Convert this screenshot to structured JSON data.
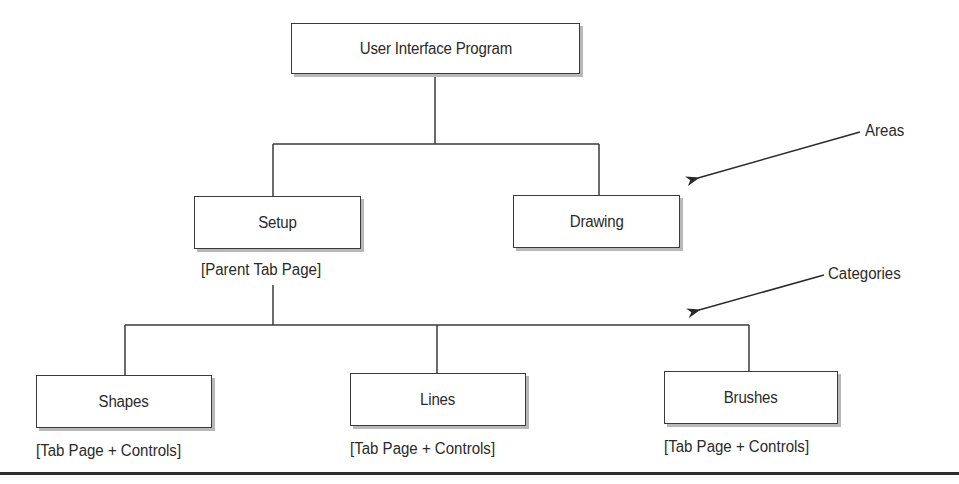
{
  "diagram": {
    "type": "hierarchy-tree",
    "root": {
      "label": "User Interface Program"
    },
    "areas": {
      "annotation": "Areas",
      "nodes": [
        {
          "label": "Setup",
          "caption": "[Parent Tab Page]"
        },
        {
          "label": "Drawing"
        }
      ]
    },
    "categories": {
      "annotation": "Categories",
      "nodes": [
        {
          "label": "Shapes",
          "caption": "[Tab Page + Controls]"
        },
        {
          "label": "Lines",
          "caption": "[Tab Page + Controls]"
        },
        {
          "label": "Brushes",
          "caption": "[Tab Page + Controls]"
        }
      ]
    },
    "edges": [
      {
        "from": "User Interface Program",
        "to": "Setup"
      },
      {
        "from": "User Interface Program",
        "to": "Drawing"
      },
      {
        "from": "Setup",
        "to": "Shapes"
      },
      {
        "from": "Setup",
        "to": "Lines"
      },
      {
        "from": "Setup",
        "to": "Brushes"
      }
    ],
    "colors": {
      "stroke": "#3a3a3a",
      "text": "#2a2a2a",
      "shadow": "#b8b8b8",
      "background": "#ffffff"
    }
  }
}
